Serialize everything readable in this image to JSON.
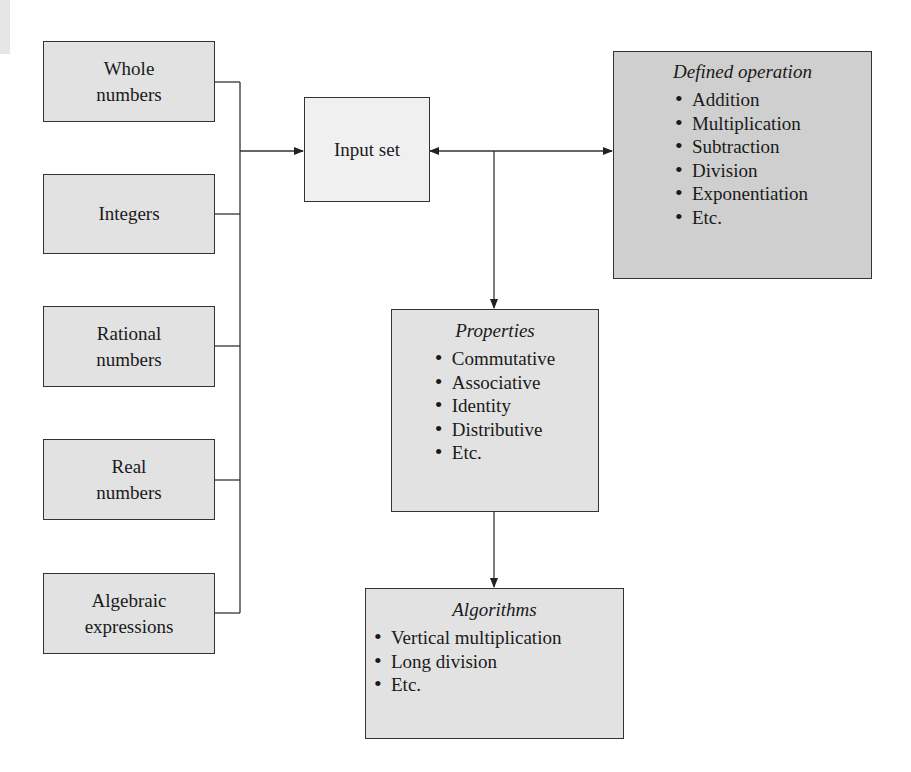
{
  "diagram": {
    "input_sources": [
      {
        "line1": "Whole",
        "line2": "numbers"
      },
      {
        "line1": "Integers",
        "line2": ""
      },
      {
        "line1": "Rational",
        "line2": "numbers"
      },
      {
        "line1": "Real",
        "line2": "numbers"
      },
      {
        "line1": "Algebraic",
        "line2": "expressions"
      }
    ],
    "input_set": {
      "label": "Input set"
    },
    "defined_operation": {
      "title": "Defined operation",
      "items": [
        "Addition",
        "Multiplication",
        "Subtraction",
        "Division",
        "Exponentiation",
        "Etc."
      ]
    },
    "properties": {
      "title": "Properties",
      "items": [
        "Commutative",
        "Associative",
        "Identity",
        "Distributive",
        "Etc."
      ]
    },
    "algorithms": {
      "title": "Algorithms",
      "items": [
        "Vertical multiplication",
        "Long division",
        "Etc."
      ]
    },
    "colors": {
      "box_fill": "#e3e3e3",
      "input_set_fill": "#f0f0f0",
      "operation_fill": "#cfcfcf",
      "stroke": "#333333"
    }
  }
}
